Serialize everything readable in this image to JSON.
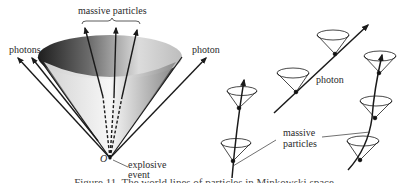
{
  "left_diagram": {
    "labels": {
      "massive_particles": "massive particles",
      "photons": "photons",
      "photon": "photon",
      "origin": "O",
      "explosive_event_line1": "explosive",
      "explosive_event_line2": "event"
    }
  },
  "right_diagram": {
    "labels": {
      "photon": "photon",
      "massive_particles_line1": "massive",
      "massive_particles_line2": "particles"
    }
  },
  "caption": "Figure 11. The world lines of particles in Minkowski space",
  "colors": {
    "ink": "#1a1a1a",
    "cone_dark": "#1e1e1e",
    "cone_light": "#f2f2f2"
  }
}
